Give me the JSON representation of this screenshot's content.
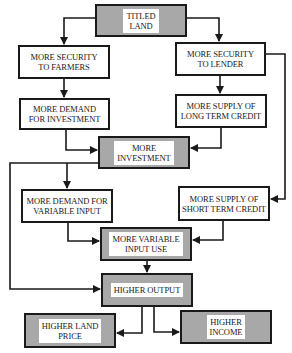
{
  "diagram": {
    "type": "flowchart",
    "nodes": [
      {
        "id": "titled_land",
        "label": "TITLED\nLAND",
        "style": "gray"
      },
      {
        "id": "security_farmers",
        "label": "MORE SECURITY\nTO FARMERS",
        "style": "white"
      },
      {
        "id": "security_lender",
        "label": "MORE SECURITY\nTO LENDER",
        "style": "white"
      },
      {
        "id": "demand_investment",
        "label": "MORE DEMAND\nFOR INVESTMENT",
        "style": "white"
      },
      {
        "id": "supply_long_credit",
        "label": "MORE SUPPLY OF\nLONG TERM CREDIT",
        "style": "white"
      },
      {
        "id": "more_investment",
        "label": "MORE\nINVESTMENT",
        "style": "gray"
      },
      {
        "id": "demand_variable_input",
        "label": "MORE DEMAND FOR\nVARIABLE INPUT",
        "style": "white"
      },
      {
        "id": "supply_short_credit",
        "label": "MORE SUPPLY OF\nSHORT TERM CREDIT",
        "style": "white"
      },
      {
        "id": "variable_input_use",
        "label": "MORE VARIABLE\nINPUT USE",
        "style": "gray"
      },
      {
        "id": "higher_output",
        "label": "HIGHER OUTPUT",
        "style": "gray"
      },
      {
        "id": "higher_land_price",
        "label": "HIGHER LAND\nPRICE",
        "style": "gray"
      },
      {
        "id": "higher_income",
        "label": "HIGHER\nINCOME",
        "style": "gray"
      }
    ],
    "edges": [
      {
        "from": "titled_land",
        "to": "security_farmers"
      },
      {
        "from": "titled_land",
        "to": "security_lender"
      },
      {
        "from": "security_farmers",
        "to": "demand_investment"
      },
      {
        "from": "security_lender",
        "to": "supply_long_credit"
      },
      {
        "from": "security_lender",
        "to": "supply_short_credit"
      },
      {
        "from": "demand_investment",
        "to": "more_investment"
      },
      {
        "from": "supply_long_credit",
        "to": "more_investment"
      },
      {
        "from": "more_investment",
        "to": "demand_variable_input"
      },
      {
        "from": "more_investment",
        "to": "higher_output"
      },
      {
        "from": "demand_variable_input",
        "to": "variable_input_use"
      },
      {
        "from": "supply_short_credit",
        "to": "variable_input_use"
      },
      {
        "from": "variable_input_use",
        "to": "higher_output"
      },
      {
        "from": "higher_output",
        "to": "higher_land_price"
      },
      {
        "from": "higher_output",
        "to": "higher_income"
      }
    ],
    "colors": {
      "gray_fill": "#a8a8a8",
      "line": "#1a1a1a",
      "white_fill": "#ffffff"
    }
  }
}
